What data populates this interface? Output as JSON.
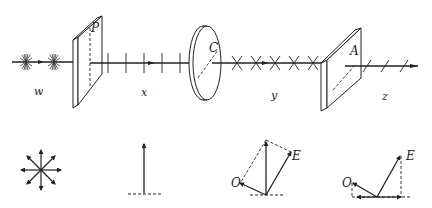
{
  "figure": {
    "optical_elements": [
      {
        "id": "P",
        "label": "P",
        "name": "polarizer"
      },
      {
        "id": "C",
        "label": "C",
        "name": "crystal-plate"
      },
      {
        "id": "A",
        "label": "A",
        "name": "analyzer"
      }
    ],
    "beam_regions": [
      {
        "label": "w",
        "state": "unpolarized"
      },
      {
        "label": "x",
        "state": "linearly polarized (vertical)"
      },
      {
        "label": "y",
        "state": "elliptically/rotated polarized"
      },
      {
        "label": "z",
        "state": "linearly polarized along analyzer axis"
      }
    ],
    "vector_diagrams": [
      {
        "name": "unpolarized-star",
        "labels": []
      },
      {
        "name": "vertical-vector",
        "labels": []
      },
      {
        "name": "ordinary-extraordinary-components",
        "labels": [
          "O",
          "E"
        ]
      },
      {
        "name": "analyzer-projection",
        "labels": [
          "O",
          "E"
        ]
      }
    ]
  },
  "labels": {
    "P": "P",
    "C": "C",
    "A": "A",
    "w": "w",
    "x": "x",
    "y": "y",
    "z": "z",
    "O1": "O",
    "E1": "E",
    "O2": "O",
    "E2": "E"
  },
  "colors": {
    "ink": "#222222",
    "background": "#ffffff"
  }
}
